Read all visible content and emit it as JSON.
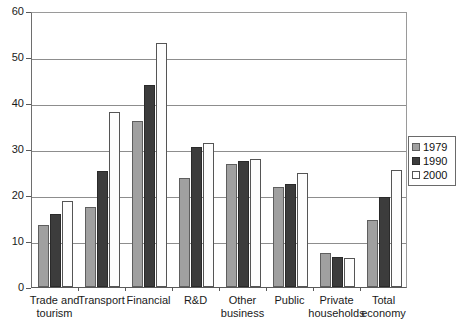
{
  "chart_data": {
    "type": "bar",
    "title": "",
    "xlabel": "",
    "ylabel": "",
    "ylim": [
      0,
      60
    ],
    "yticks": [
      0,
      10,
      20,
      30,
      40,
      50,
      60
    ],
    "grid": true,
    "legend_position": "right",
    "categories": [
      "Trade and tourism",
      "Transport",
      "Financial",
      "R&D",
      "Other business",
      "Public",
      "Private households",
      "Total economy"
    ],
    "category_lines": [
      [
        "Trade and",
        "tourism"
      ],
      [
        "Transport",
        ""
      ],
      [
        "Financial",
        ""
      ],
      [
        "R&D",
        ""
      ],
      [
        "Other",
        "business"
      ],
      [
        "Public",
        ""
      ],
      [
        "Private",
        "households"
      ],
      [
        "Total",
        "economy"
      ]
    ],
    "series": [
      {
        "name": "1979",
        "color": "#a0a0a0",
        "values": [
          13.5,
          17.3,
          36.0,
          23.8,
          26.7,
          21.7,
          7.3,
          14.5
        ]
      },
      {
        "name": "1990",
        "color": "#3c3c3c",
        "values": [
          15.8,
          25.3,
          44.0,
          30.5,
          27.5,
          22.5,
          6.5,
          19.5
        ]
      },
      {
        "name": "2000",
        "color": "#ffffff",
        "values": [
          18.8,
          38.0,
          53.0,
          31.2,
          27.8,
          24.8,
          6.3,
          25.4
        ]
      }
    ]
  },
  "legend": {
    "items": [
      {
        "label": "1979",
        "series": "s1979"
      },
      {
        "label": "1990",
        "series": "s1990"
      },
      {
        "label": "2000",
        "series": "s2000"
      }
    ]
  }
}
